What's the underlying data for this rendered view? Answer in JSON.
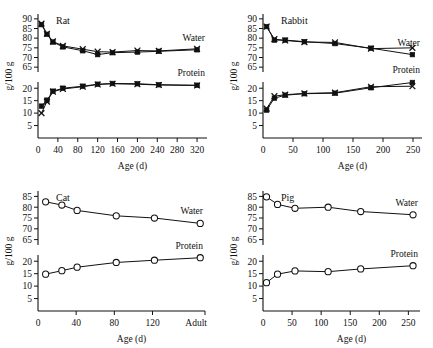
{
  "figure": {
    "axis_label_y": "g/100 g",
    "axis_label_x": "Age (d)",
    "series_label_water": "Water",
    "series_label_protein": "Protein"
  },
  "chart_data": [
    {
      "type": "line",
      "title": "Rat",
      "xlabel": "Age (d)",
      "ylabel": "g/100 g",
      "xlim": [
        0,
        340
      ],
      "xticks": [
        0,
        40,
        80,
        120,
        160,
        200,
        240,
        280,
        320
      ],
      "yticks_upper": [
        65,
        70,
        75,
        80,
        85,
        90
      ],
      "yticks_lower": [
        5,
        10,
        15,
        20
      ],
      "broken_axis": true,
      "grid": false,
      "legend": "inline-right",
      "series": [
        {
          "name": "Water",
          "marker": "square",
          "x": [
            7,
            18,
            30,
            50,
            90,
            120,
            150,
            200,
            243,
            320
          ],
          "y": [
            87.0,
            82.0,
            78.0,
            75.5,
            73.5,
            71.5,
            72.5,
            72.8,
            73.2,
            74.0
          ]
        },
        {
          "name": "Water",
          "marker": "x",
          "x": [
            7,
            18,
            30,
            50,
            90,
            120,
            150,
            200,
            243,
            320
          ],
          "y": [
            87.5,
            82.3,
            78.3,
            76.0,
            74.3,
            73.0,
            72.8,
            73.6,
            73.4,
            74.5
          ]
        },
        {
          "name": "Protein",
          "marker": "square",
          "x": [
            7,
            18,
            30,
            50,
            90,
            120,
            150,
            200,
            243,
            320
          ],
          "y": [
            12.8,
            15.2,
            18.8,
            20.0,
            20.8,
            21.6,
            21.9,
            21.8,
            21.4,
            21.2
          ]
        },
        {
          "name": "Protein",
          "marker": "x",
          "x": [
            7,
            18,
            30,
            50,
            90,
            120,
            150,
            200,
            243,
            320
          ],
          "y": [
            10.0,
            14.6,
            18.6,
            19.7,
            20.6,
            21.5,
            21.8,
            21.6,
            21.3,
            21.1
          ]
        }
      ]
    },
    {
      "type": "line",
      "title": "Rabbit",
      "xlabel": "Age (d)",
      "ylabel": "g/100 g",
      "xlim": [
        0,
        265
      ],
      "xticks": [
        0,
        50,
        100,
        150,
        200,
        250
      ],
      "yticks_upper": [
        65,
        70,
        75,
        80,
        85,
        90
      ],
      "yticks_lower": [
        5,
        10,
        15,
        20
      ],
      "broken_axis": true,
      "grid": false,
      "legend": "inline-right",
      "series": [
        {
          "name": "Water",
          "marker": "square",
          "x": [
            6,
            19,
            37,
            69,
            120,
            180,
            249
          ],
          "y": [
            86.0,
            79.0,
            79.0,
            78.2,
            77.2,
            74.8,
            71.5
          ]
        },
        {
          "name": "Water",
          "marker": "x",
          "x": [
            6,
            19,
            37,
            69,
            120,
            180,
            249
          ],
          "y": [
            86.0,
            79.5,
            78.8,
            78.0,
            77.8,
            74.6,
            75.0
          ]
        },
        {
          "name": "Protein",
          "marker": "square",
          "x": [
            6,
            19,
            37,
            69,
            120,
            180,
            249
          ],
          "y": [
            11.2,
            16.0,
            17.2,
            17.8,
            18.0,
            20.2,
            22.3
          ]
        },
        {
          "name": "Protein",
          "marker": "x",
          "x": [
            6,
            19,
            37,
            69,
            120,
            180,
            249
          ],
          "y": [
            11.8,
            16.8,
            17.4,
            17.9,
            18.2,
            20.6,
            20.8
          ]
        }
      ]
    },
    {
      "type": "line",
      "title": "Cat",
      "xlabel": "Age (d)",
      "ylabel": "g/100 g",
      "xlim": [
        0,
        175
      ],
      "xticks": [
        0,
        40,
        80,
        120
      ],
      "xtick_labels": [
        "0",
        "40",
        "80",
        "120",
        "Adult"
      ],
      "yticks_upper": [
        65,
        70,
        75,
        80,
        85
      ],
      "yticks_lower": [
        5,
        10,
        15,
        20
      ],
      "broken_axis": true,
      "grid": false,
      "legend": "inline-right",
      "series": [
        {
          "name": "Water",
          "marker": "circle",
          "x": [
            8,
            25,
            41,
            82,
            122,
            170
          ],
          "y": [
            82.5,
            81.0,
            78.5,
            76.0,
            75.0,
            72.5
          ]
        },
        {
          "name": "Protein",
          "marker": "circle",
          "x": [
            8,
            25,
            41,
            82,
            122,
            170
          ],
          "y": [
            14.8,
            16.2,
            17.6,
            19.5,
            20.4,
            21.4
          ]
        }
      ]
    },
    {
      "type": "line",
      "title": "Pig",
      "xlabel": "Age (d)",
      "ylabel": "g/100 g",
      "xlim": [
        0,
        270
      ],
      "xticks": [
        0,
        50,
        100,
        150,
        200,
        250
      ],
      "yticks_upper": [
        65,
        70,
        75,
        80,
        85
      ],
      "yticks_lower": [
        5,
        10,
        15,
        20
      ],
      "broken_axis": true,
      "grid": false,
      "legend": "inline-right",
      "series": [
        {
          "name": "Water",
          "marker": "circle",
          "x": [
            6,
            25,
            55,
            112,
            168,
            258
          ],
          "y": [
            84.8,
            81.3,
            79.5,
            80.0,
            78.0,
            76.5
          ]
        },
        {
          "name": "Protein",
          "marker": "circle",
          "x": [
            6,
            25,
            55,
            112,
            168,
            258
          ],
          "y": [
            11.4,
            14.8,
            16.1,
            15.8,
            16.9,
            18.2
          ]
        }
      ]
    }
  ]
}
